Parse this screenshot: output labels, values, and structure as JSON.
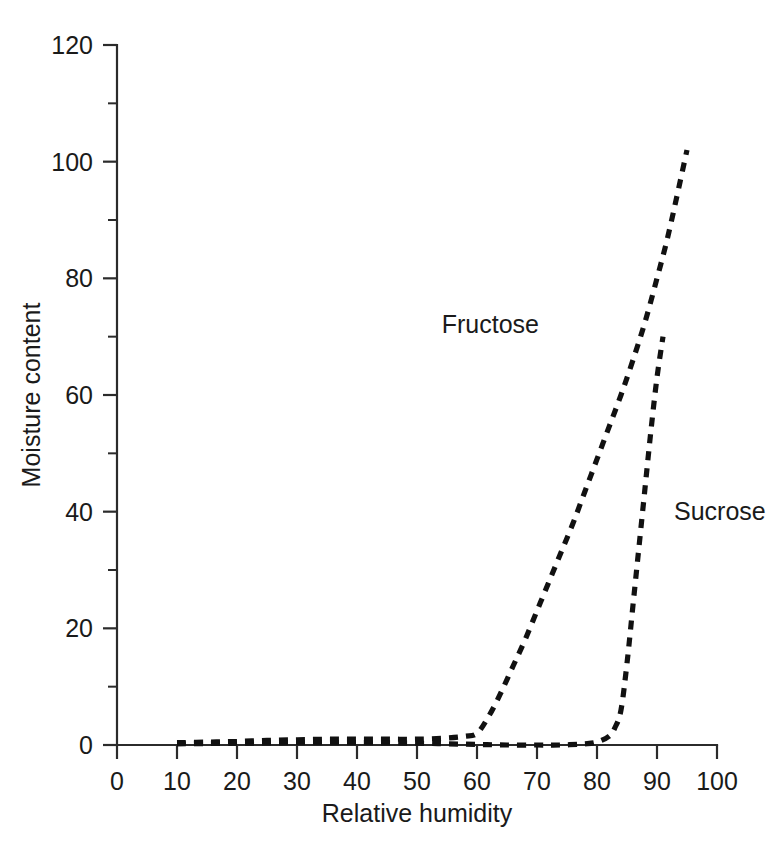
{
  "chart_data": {
    "type": "line",
    "title": "",
    "xlabel": "Relative humidity",
    "ylabel": "Moisture content",
    "xlim": [
      0,
      100
    ],
    "ylim": [
      0,
      120
    ],
    "grid": false,
    "legend_position": "inline-annotations",
    "x_ticks": [
      0,
      10,
      20,
      30,
      40,
      50,
      60,
      70,
      80,
      90,
      100
    ],
    "x_tick_labels": [
      "0",
      "10",
      "20",
      "30",
      "40",
      "50",
      "60",
      "70",
      "80",
      "90",
      "100"
    ],
    "x_minor_ticks": [
      5,
      15,
      25,
      35,
      45,
      55,
      65,
      75,
      85,
      95
    ],
    "y_ticks": [
      0,
      20,
      40,
      60,
      80,
      100,
      120
    ],
    "y_tick_labels": [
      "0",
      "20",
      "40",
      "60",
      "80",
      "100",
      "120"
    ],
    "y_minor_ticks": [
      10,
      30,
      50,
      70,
      90,
      110
    ],
    "series": [
      {
        "name": "Fructose",
        "label": "Fructose",
        "style": "dashed",
        "color": "#111111",
        "annotation_x": 72,
        "annotation_y": 72,
        "x": [
          10,
          15,
          20,
          25,
          30,
          35,
          40,
          45,
          50,
          55,
          58,
          60,
          62,
          64,
          66,
          68,
          70,
          72,
          74,
          76,
          78,
          80,
          82,
          84,
          86,
          88,
          90,
          92,
          95
        ],
        "y": [
          0.4,
          0.5,
          0.6,
          0.8,
          0.9,
          1.0,
          1.0,
          1.0,
          1.0,
          1.2,
          1.5,
          2.0,
          5.0,
          9.0,
          13.5,
          18.0,
          23.0,
          28.0,
          33.0,
          38.0,
          43.5,
          49.0,
          54.5,
          60.0,
          66.0,
          72.5,
          80.0,
          88.0,
          102.0
        ]
      },
      {
        "name": "Sucrose",
        "label": "Sucrose",
        "style": "dashed",
        "color": "#111111",
        "annotation_x": 91.5,
        "annotation_y": 40,
        "x": [
          10,
          20,
          30,
          40,
          50,
          55,
          60,
          65,
          70,
          74,
          78,
          80,
          82,
          83,
          84,
          85,
          86,
          87,
          88,
          89,
          90,
          91
        ],
        "y": [
          0.2,
          0.3,
          0.4,
          0.4,
          0.3,
          0.2,
          0.1,
          0.0,
          0.0,
          0.0,
          0.2,
          0.5,
          1.5,
          3.0,
          6.0,
          14.0,
          24.0,
          34.0,
          44.0,
          54.0,
          63.0,
          70.0
        ]
      }
    ]
  },
  "axis": {
    "x_title": "Relative humidity",
    "y_title": "Moisture content"
  }
}
